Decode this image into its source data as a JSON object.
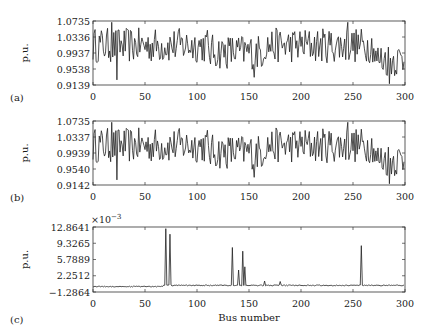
{
  "chart_data": [
    {
      "type": "line",
      "panel_label": "(a)",
      "title": "",
      "xlabel": "",
      "ylabel": "p.u.",
      "xlim": [
        0,
        300
      ],
      "ylim": [
        0.9139,
        1.0735
      ],
      "xticks": [
        0,
        50,
        100,
        150,
        200,
        250,
        300
      ],
      "yticks": [
        "0.9139",
        "0.9538",
        "0.9937",
        "1.0336",
        "1.0735"
      ],
      "grid": false,
      "legend": null,
      "note": "300-point series approximating the visible trace shape; not exact per-bus values",
      "series": [
        {
          "name": "a",
          "values": []
        }
      ]
    },
    {
      "type": "line",
      "panel_label": "(b)",
      "title": "",
      "xlabel": "",
      "ylabel": "p.u.",
      "xlim": [
        0,
        300
      ],
      "ylim": [
        0.9142,
        1.0735
      ],
      "xticks": [
        0,
        50,
        100,
        150,
        200,
        250,
        300
      ],
      "yticks": [
        "0.9142",
        "0.9540",
        "0.9939",
        "1.0337",
        "1.0735"
      ],
      "grid": false,
      "legend": null,
      "note": "300-point series approximating the visible trace shape; not exact per-bus values",
      "series": [
        {
          "name": "b",
          "values": []
        }
      ]
    },
    {
      "type": "line",
      "panel_label": "(c)",
      "title": "",
      "xlabel": "Bus number",
      "ylabel": "p.u.",
      "y_scale_annotation": "×10^-3",
      "xlim": [
        0,
        300
      ],
      "ylim": [
        -1.2864,
        12.8641
      ],
      "xticks": [
        0,
        50,
        100,
        150,
        200,
        250,
        300
      ],
      "yticks": [
        "-1.2864",
        "2.2512",
        "5.7889",
        "9.3265",
        "12.8641"
      ],
      "grid": false,
      "legend": null,
      "note": "Spike positions and approximate amplitudes read against axis ticks; baseline near 0",
      "spikes": [
        {
          "bus": 70,
          "value": 12.5
        },
        {
          "bus": 74,
          "value": 11.3
        },
        {
          "bus": 134,
          "value": 8.4
        },
        {
          "bus": 140,
          "value": 3.5
        },
        {
          "bus": 144,
          "value": 7.6
        },
        {
          "bus": 146,
          "value": 4.2
        },
        {
          "bus": 165,
          "value": 1.1
        },
        {
          "bus": 180,
          "value": 1.0
        },
        {
          "bus": 258,
          "value": 8.8
        }
      ],
      "series": [
        {
          "name": "c",
          "values": []
        }
      ]
    }
  ]
}
